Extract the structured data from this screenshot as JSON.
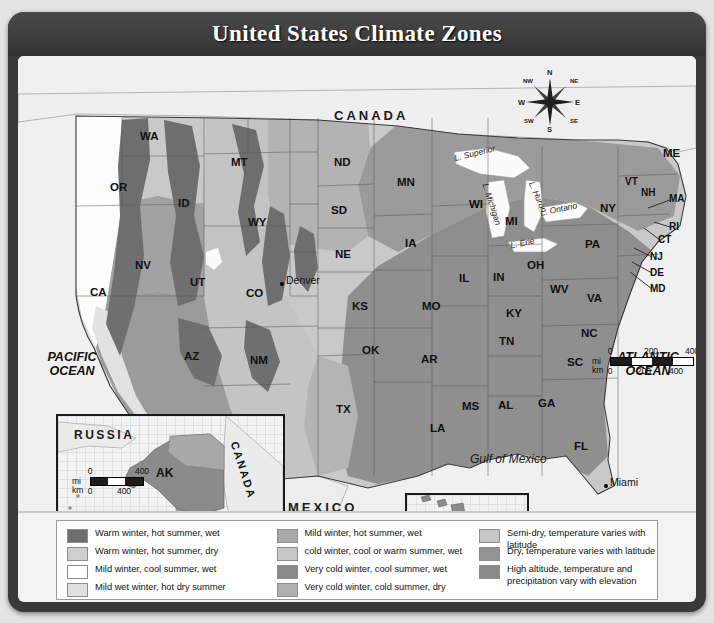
{
  "title": "United States Climate Zones",
  "map": {
    "countries": [
      {
        "name": "CANADA",
        "x": 330,
        "y": 58
      },
      {
        "name": "MEXICO",
        "x": 284,
        "y": 452
      }
    ],
    "oceans": [
      {
        "name": "PACIFIC\nOCEAN",
        "line1": "PACIFIC",
        "line2": "OCEAN",
        "x": 30,
        "y": 300
      },
      {
        "name": "ATLANTIC\nOCEAN",
        "line1": "ATLANTIC",
        "line2": "OCEAN",
        "x": 604,
        "y": 300
      }
    ],
    "gulf_label": "Gulf of Mexico",
    "lakes": [
      {
        "name": "L. Superior"
      },
      {
        "name": "L. Michigan"
      },
      {
        "name": "L. Huron"
      },
      {
        "name": "L. Ontario"
      },
      {
        "name": "L. Erie"
      }
    ],
    "cities": [
      {
        "name": "Denver",
        "x": 268,
        "y": 222
      },
      {
        "name": "Miami",
        "x": 592,
        "y": 424
      }
    ],
    "states": [
      {
        "code": "WA",
        "x": 122,
        "y": 80
      },
      {
        "code": "OR",
        "x": 99,
        "y": 131
      },
      {
        "code": "ID",
        "x": 163,
        "y": 147
      },
      {
        "code": "MT",
        "x": 221,
        "y": 110
      },
      {
        "code": "WY",
        "x": 239,
        "y": 170
      },
      {
        "code": "NV",
        "x": 122,
        "y": 210
      },
      {
        "code": "UT",
        "x": 179,
        "y": 227
      },
      {
        "code": "CA",
        "x": 80,
        "y": 238
      },
      {
        "code": "AZ",
        "x": 173,
        "y": 300
      },
      {
        "code": "NM",
        "x": 242,
        "y": 305
      },
      {
        "code": "CO",
        "x": 249,
        "y": 240
      },
      {
        "code": "ND",
        "x": 323,
        "y": 108
      },
      {
        "code": "SD",
        "x": 320,
        "y": 156
      },
      {
        "code": "NE",
        "x": 324,
        "y": 200
      },
      {
        "code": "KS",
        "x": 341,
        "y": 252
      },
      {
        "code": "OK",
        "x": 351,
        "y": 296
      },
      {
        "code": "TX",
        "x": 325,
        "y": 355
      },
      {
        "code": "MN",
        "x": 386,
        "y": 128
      },
      {
        "code": "IA",
        "x": 392,
        "y": 189
      },
      {
        "code": "MO",
        "x": 411,
        "y": 252
      },
      {
        "code": "AR",
        "x": 410,
        "y": 305
      },
      {
        "code": "LA",
        "x": 419,
        "y": 374
      },
      {
        "code": "WI",
        "x": 458,
        "y": 150
      },
      {
        "code": "IL",
        "x": 446,
        "y": 224
      },
      {
        "code": "MS",
        "x": 451,
        "y": 352
      },
      {
        "code": "IN",
        "x": 481,
        "y": 223
      },
      {
        "code": "MI",
        "x": 494,
        "y": 167
      },
      {
        "code": "OH",
        "x": 516,
        "y": 211
      },
      {
        "code": "KY",
        "x": 495,
        "y": 259
      },
      {
        "code": "TN",
        "x": 488,
        "y": 287
      },
      {
        "code": "AL",
        "x": 487,
        "y": 351
      },
      {
        "code": "GA",
        "x": 527,
        "y": 349
      },
      {
        "code": "FL",
        "x": 562,
        "y": 392
      },
      {
        "code": "SC",
        "x": 556,
        "y": 308
      },
      {
        "code": "NC",
        "x": 570,
        "y": 279
      },
      {
        "code": "VA",
        "x": 576,
        "y": 244
      },
      {
        "code": "WV",
        "x": 541,
        "y": 235
      },
      {
        "code": "PA",
        "x": 574,
        "y": 190
      },
      {
        "code": "NY",
        "x": 589,
        "y": 154
      },
      {
        "code": "VT",
        "x": 613,
        "y": 127
      },
      {
        "code": "NH",
        "x": 629,
        "y": 137
      },
      {
        "code": "ME",
        "x": 651,
        "y": 99
      },
      {
        "code": "MA",
        "x": 657,
        "y": 143
      },
      {
        "code": "RI",
        "x": 656,
        "y": 170
      },
      {
        "code": "CT",
        "x": 645,
        "y": 183
      },
      {
        "code": "NJ",
        "x": 637,
        "y": 200
      },
      {
        "code": "DE",
        "x": 637,
        "y": 216
      },
      {
        "code": "MD",
        "x": 637,
        "y": 232
      }
    ]
  },
  "compass": {
    "n": "N",
    "ne": "NE",
    "e": "E",
    "se": "SE",
    "s": "S",
    "sw": "SW",
    "w": "W",
    "nw": "NW"
  },
  "scales": {
    "main": {
      "mi_unit": "mi",
      "km_unit": "km",
      "mi_ticks": [
        "0",
        "200",
        "400"
      ],
      "km_ticks": [
        "0",
        "200",
        "400"
      ]
    },
    "alaska": {
      "mi_unit": "mi",
      "km_unit": "km",
      "mi_ticks": [
        "0",
        "400"
      ],
      "km_ticks": [
        "0",
        "400"
      ]
    },
    "hawaii": {
      "mi_unit": "mi",
      "km_unit": "km",
      "mi_ticks": [
        "0",
        "100"
      ],
      "km_ticks": [
        "0",
        "100"
      ]
    }
  },
  "insets": {
    "alaska": {
      "state": "AK",
      "neighbor_west": "RUSSIA",
      "neighbor_east": "CANADA"
    },
    "hawaii": {
      "state": "HI"
    }
  },
  "legend": {
    "columns": [
      {
        "items": [
          {
            "label": "Warm winter, hot summer, wet",
            "color": "#6e6e6e"
          },
          {
            "label": "Warm winter, hot summer, dry",
            "color": "#cfcfcf"
          },
          {
            "label": "Mild winter, cool summer, wet",
            "color": "#ffffff"
          },
          {
            "label": "Mild wet winter, hot dry summer",
            "color": "#e0e0e0"
          }
        ]
      },
      {
        "items": [
          {
            "label": "Mild winter, hot summer, wet",
            "color": "#a8a8a8"
          },
          {
            "label": "cold winter, cool or warm summer, wet",
            "color": "#c6c6c6"
          },
          {
            "label": "Very cold winter, cool summer, wet",
            "color": "#8a8a8a"
          },
          {
            "label": "Very cold winter, cold summer, dry",
            "color": "#b0b0b0"
          }
        ]
      },
      {
        "items": [
          {
            "label": "Semi-dry, temperature varies with latitude",
            "color": "#c6c6c6"
          },
          {
            "label": "Dry, temperature varies with latitude",
            "color": "#949494"
          },
          {
            "label": "High altitude, temperature and\nprecipitation vary with elevation",
            "color": "#8a8a8a",
            "tall": true
          }
        ]
      }
    ]
  }
}
